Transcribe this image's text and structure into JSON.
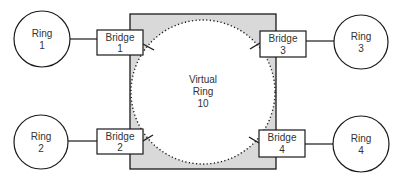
{
  "colors": {
    "stroke": "#1a1a1a",
    "backplane_fill": "#d9d9d9",
    "virtual_ring_fill": "#ffffff",
    "text": "#333333"
  },
  "virtual_ring": {
    "line1": "Virtual",
    "line2": "Ring",
    "line3": "10"
  },
  "rings": [
    {
      "line1": "Ring",
      "line2": "1"
    },
    {
      "line1": "Ring",
      "line2": "2"
    },
    {
      "line1": "Ring",
      "line2": "3"
    },
    {
      "line1": "Ring",
      "line2": "4"
    }
  ],
  "bridges": [
    {
      "line1": "Bridge",
      "line2": "1"
    },
    {
      "line1": "Bridge",
      "line2": "2"
    },
    {
      "line1": "Bridge",
      "line2": "3"
    },
    {
      "line1": "Bridge",
      "line2": "4"
    }
  ]
}
